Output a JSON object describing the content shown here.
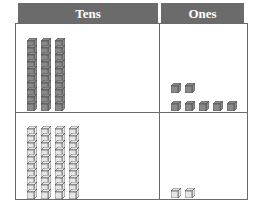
{
  "chart": {
    "headers": {
      "tens": "Tens",
      "ones": "Ones"
    },
    "rows": [
      {
        "tens": 3,
        "ones": 7,
        "shade": "dark"
      },
      {
        "tens": 4,
        "ones": 2,
        "shade": "light"
      }
    ],
    "colors": {
      "header_bg": "#6b6b6b",
      "dark_block": "#8a8a8a",
      "light_block": "#e6e6e6",
      "border": "#6a6a6a"
    }
  }
}
